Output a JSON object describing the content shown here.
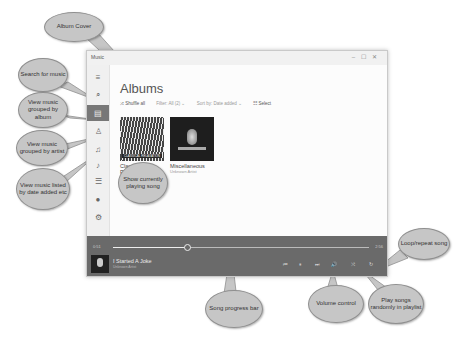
{
  "window": {
    "app_title": "Music",
    "controls": [
      "–",
      "☐",
      "✕"
    ]
  },
  "sidebar": {
    "items": [
      {
        "name": "menu",
        "glyph": "≡"
      },
      {
        "name": "search",
        "glyph": "⌕"
      },
      {
        "name": "albums",
        "glyph": "▤",
        "active": true
      },
      {
        "name": "artists",
        "glyph": "♙"
      },
      {
        "name": "songs",
        "glyph": "♫"
      },
      {
        "name": "now-playing",
        "glyph": "♪"
      },
      {
        "name": "playlists",
        "glyph": "☰"
      },
      {
        "name": "account",
        "glyph": "●"
      },
      {
        "name": "settings",
        "glyph": "⚙"
      }
    ]
  },
  "main": {
    "title": "Albums",
    "toolbar": {
      "shuffle": "⤨ Shuffle all",
      "filter": "Filter: All (2) ⌄",
      "sort": "Sort by: Date added ⌄",
      "select": "☷ Select"
    },
    "albums": [
      {
        "title": "Classical Relaxation",
        "artist": "Various Artists",
        "cover_caption": "CLASSICAL RELAXATION"
      },
      {
        "title": "Miscellaneous",
        "artist": "Unknown Artist"
      }
    ]
  },
  "player": {
    "elapsed": "0:51",
    "duration": "2:56",
    "progress_percent": 29,
    "song_title": "I Started A Joke",
    "song_artist": "Unknown Artist",
    "controls": [
      {
        "name": "previous",
        "glyph": "⏮"
      },
      {
        "name": "play-pause",
        "glyph": "⏸"
      },
      {
        "name": "next",
        "glyph": "⏭"
      },
      {
        "name": "volume",
        "glyph": "🔊"
      },
      {
        "name": "shuffle",
        "glyph": "⤨"
      },
      {
        "name": "repeat",
        "glyph": "↻"
      }
    ]
  },
  "annotations": {
    "album_cover": "Album Cover",
    "search": "Search for music",
    "by_album": "View music grouped by album",
    "by_artist": "View music grouped by artist",
    "by_date": "View music listed by date added etc",
    "now_playing": "Show currently playing song",
    "progress": "Song progress bar",
    "volume": "Volume control",
    "shuffle": "Play songs randomly in playlist",
    "repeat": "Loop/repeat song"
  }
}
